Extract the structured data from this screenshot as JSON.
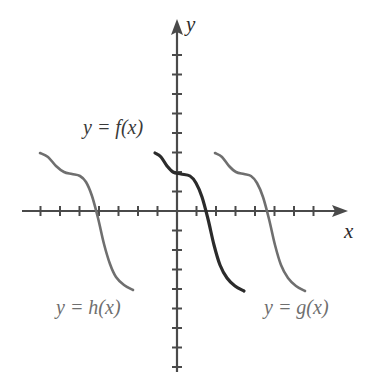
{
  "figure": {
    "title": "",
    "background_color": "#ffffff"
  },
  "axes": {
    "x_axis_label": "x",
    "y_axis_label": "y",
    "x_axis_color": "#4a4a4a",
    "y_axis_color": "#4a4a4a",
    "origin_px": {
      "x": 177,
      "y": 211
    },
    "tick_spacing_px": 19.5,
    "x_axis_span_px": {
      "start": 22,
      "end": 348
    },
    "y_axis_span_px": {
      "start": 19,
      "end": 372
    },
    "x_tick_count_left": 8,
    "x_tick_count_right": 8,
    "y_tick_count_up": 8,
    "y_tick_count_down": 8,
    "tick_half_length_px": 5,
    "arrowheads": [
      "x-positive",
      "y-positive"
    ],
    "tick_labels_shown": false,
    "grid": false
  },
  "curves": [
    {
      "id": "h",
      "label": "y = h(x)",
      "color": "#6f6f6f",
      "stroke_width": 2.6,
      "shift_px": -122,
      "label_position_px": {
        "x": 56,
        "y": 296
      },
      "x_intercept_px": 95
    },
    {
      "id": "f",
      "label": "y = f(x)",
      "color": "#2b2b2b",
      "stroke_width": 3.2,
      "shift_px": 0,
      "label_position_px": {
        "x": 83,
        "y": 116
      },
      "x_intercept_px": 208
    },
    {
      "id": "g",
      "label": "y = g(x)",
      "color": "#6f6f6f",
      "stroke_width": 2.6,
      "shift_px": 60,
      "label_position_px": {
        "x": 264,
        "y": 296
      },
      "x_intercept_px": 267
    }
  ],
  "chart_data": {
    "type": "line",
    "title": "",
    "xlabel": "x",
    "ylabel": "y",
    "grid": false,
    "legend_position": "inline-annotations",
    "annotations": [
      "y = f(x)",
      "y = h(x)",
      "y = g(x)"
    ],
    "series": [
      {
        "name": "y = h(x)",
        "color": "#6f6f6f",
        "points_px": [
          [
            40,
            153
          ],
          [
            48,
            157
          ],
          [
            56,
            166
          ],
          [
            64,
            172
          ],
          [
            72,
            174
          ],
          [
            80,
            176
          ],
          [
            86,
            182
          ],
          [
            92,
            196
          ],
          [
            98,
            218
          ],
          [
            104,
            244
          ],
          [
            110,
            264
          ],
          [
            116,
            277
          ],
          [
            124,
            285
          ],
          [
            133,
            290
          ]
        ]
      },
      {
        "name": "y = f(x)",
        "color": "#2b2b2b",
        "points_px": [
          [
            155,
            153
          ],
          [
            161,
            157
          ],
          [
            167,
            166
          ],
          [
            173,
            172
          ],
          [
            181,
            174
          ],
          [
            190,
            176
          ],
          [
            196,
            183
          ],
          [
            202,
            197
          ],
          [
            208,
            219
          ],
          [
            214,
            245
          ],
          [
            220,
            265
          ],
          [
            227,
            278
          ],
          [
            235,
            286
          ],
          [
            244,
            291
          ]
        ]
      },
      {
        "name": "y = g(x)",
        "color": "#6f6f6f",
        "points_px": [
          [
            215,
            153
          ],
          [
            222,
            157
          ],
          [
            229,
            166
          ],
          [
            236,
            172
          ],
          [
            244,
            174
          ],
          [
            251,
            176
          ],
          [
            257,
            183
          ],
          [
            263,
            197
          ],
          [
            269,
            219
          ],
          [
            275,
            245
          ],
          [
            281,
            265
          ],
          [
            288,
            278
          ],
          [
            296,
            286
          ],
          [
            305,
            291
          ]
        ]
      }
    ]
  }
}
